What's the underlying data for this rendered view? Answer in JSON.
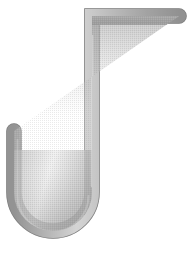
{
  "scene": {
    "title": "J-shaped metal hook illustration",
    "background_color": "#ffffff",
    "width": 189,
    "height": 274
  },
  "object": {
    "name": "hook",
    "description": "A J-shaped / inverted-hook metal rod with a horizontal top arm, a long vertical shaft, a rounded U bend at the bottom and a short upward left arm",
    "stroke_color": "#8f8f8f",
    "fill_color": "#b4b4b4",
    "highlight_color": "#fbfbfb",
    "shadow_color": "#9c9c9c",
    "rod_thickness_px": 15,
    "parts": [
      {
        "name": "top-horizontal-arm",
        "label": "Top horizontal arm",
        "start_x": 92,
        "start_y": 16,
        "end_x": 179,
        "end_y": 16,
        "end_cap": "round"
      },
      {
        "name": "vertical-shaft",
        "label": "Vertical shaft",
        "start_x": 92,
        "start_y": 16,
        "end_x": 92,
        "end_y": 192,
        "corner": "square"
      },
      {
        "name": "bottom-u-bend",
        "label": "Bottom U bend",
        "center_x": 53,
        "center_y": 192,
        "radius": 39,
        "sweep": "180deg"
      },
      {
        "name": "left-upward-arm",
        "label": "Left upward arm",
        "start_x": 14,
        "start_y": 192,
        "end_x": 14,
        "end_y": 131,
        "end_cap": "round"
      }
    ]
  }
}
